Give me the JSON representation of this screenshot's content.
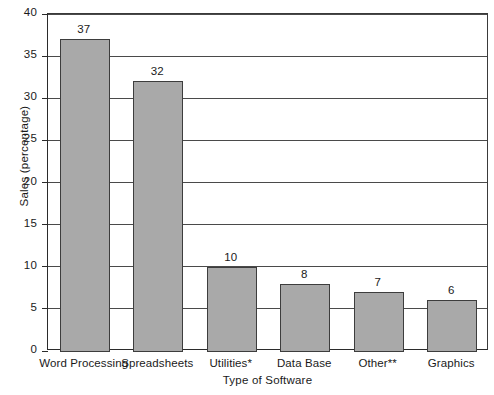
{
  "chart_data": {
    "type": "bar",
    "title": "",
    "subtitle": "",
    "xlabel": "Type of Software",
    "ylabel": "Sales (percentage)",
    "categories": [
      "Word Processing",
      "Spreadsheets",
      "Utilities*",
      "Data Base",
      "Other**",
      "Graphics"
    ],
    "values": [
      37,
      32,
      10,
      8,
      7,
      6
    ],
    "data_labels": [
      "37",
      "32",
      "10",
      "8",
      "7",
      "6"
    ],
    "ylim": [
      0,
      40
    ],
    "ytick_labels": [
      "0",
      "5",
      "10",
      "15",
      "20",
      "25",
      "30",
      "35",
      "40"
    ],
    "ytick_values": [
      0,
      5,
      10,
      15,
      20,
      25,
      30,
      35,
      40
    ],
    "grid": "horizontal",
    "legend": "none",
    "bar_fill_color": "#a9a9a9",
    "bar_edge_color": "#3d3d3d",
    "axis_color": "#2b2b2b",
    "background_color": "#ffffff"
  }
}
